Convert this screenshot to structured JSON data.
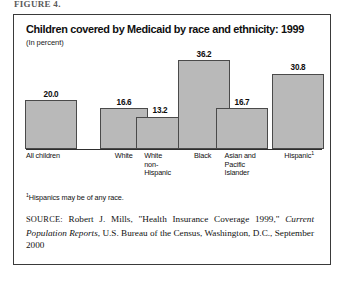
{
  "clipped_header": "FIGURE 4.",
  "figure": {
    "title": "Children covered by Medicaid by race and ethnicity: 1999",
    "subtitle": "(In percent)",
    "footnote_marker": "1",
    "footnote_text": "Hispanics may be of any race.",
    "source": {
      "label": "SOURCE:",
      "text_before_italic": " Robert J. Mills, \"Health Insurance Coverage 1999,\" ",
      "italic_text": "Current Population Reports",
      "text_after_italic": ", U.S. Bureau of the Census, Washington, D.C., September 2000"
    },
    "colors": {
      "bar_fill": "#b9b9b9",
      "bar_outline": "#4a4a4a",
      "border": "#3a3a3a",
      "text": "#111111",
      "background": "#ffffff"
    }
  },
  "chart_data": {
    "type": "bar",
    "title": "Children covered by Medicaid by race and ethnicity: 1999",
    "subtitle": "(In percent)",
    "xlabel": "",
    "ylabel": "Percent",
    "ylim": [
      0,
      40
    ],
    "grid": false,
    "legend": "none",
    "categories": [
      "All children",
      "White",
      "White non-Hispanic",
      "Black",
      "Asian and Pacific Islander",
      "Hispanic"
    ],
    "category_lines": [
      [
        "All children"
      ],
      [
        "White"
      ],
      [
        "White",
        "non-",
        "Hispanic"
      ],
      [
        "Black"
      ],
      [
        "Asian and",
        "Pacific",
        "Islander"
      ],
      [
        "Hispanic"
      ]
    ],
    "values": [
      20.0,
      16.6,
      13.2,
      36.2,
      16.7,
      30.8
    ],
    "value_labels": [
      "20.0",
      "16.6",
      "13.2",
      "36.2",
      "16.7",
      "30.8"
    ],
    "footnoted_categories": [
      "Hispanic"
    ],
    "annotations": [
      "1 Hispanics may be of any race."
    ]
  }
}
